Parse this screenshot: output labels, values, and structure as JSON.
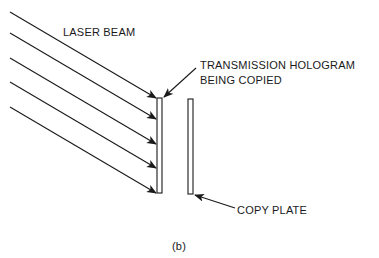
{
  "diagram": {
    "labels": {
      "laser_beam": "LASER BEAM",
      "hologram_line1": "TRANSMISSION HOLOGRAM",
      "hologram_line2": "BEING COPIED",
      "copy_plate": "COPY PLATE",
      "caption": "(b)"
    },
    "elements": {
      "laser_beam_rays": 5,
      "plates": [
        "transmission hologram",
        "copy plate"
      ]
    },
    "colors": {
      "ink": "#1a1a1a",
      "background": "#ffffff"
    }
  }
}
